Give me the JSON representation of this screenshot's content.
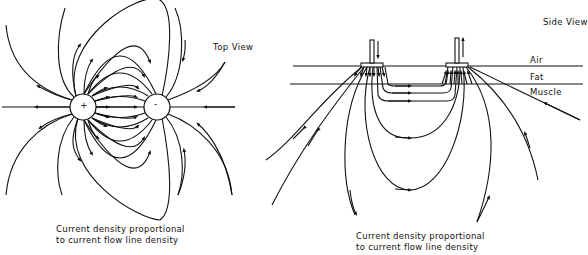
{
  "top_view": {
    "title": "Top View",
    "electrodes": [
      {
        "symbol": "+",
        "polarity": "positive"
      },
      {
        "symbol": "-",
        "polarity": "negative"
      }
    ],
    "caption_line1": "Current density proportional",
    "caption_line2": "to current flow line density"
  },
  "side_view": {
    "title": "Side View",
    "layers": [
      "Air",
      "Fat",
      "Muscle"
    ],
    "caption_line1": "Current density proportional",
    "caption_line2": "to current flow line density"
  },
  "colors": {
    "line": "#111111",
    "background": "#ffffff"
  }
}
